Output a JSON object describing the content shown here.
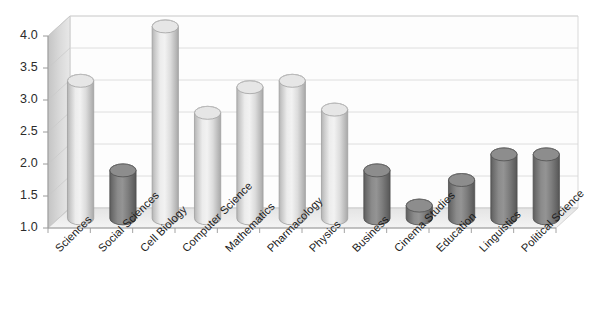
{
  "chart_data": {
    "type": "bar",
    "title": "",
    "subtitle": "",
    "xlabel": "",
    "ylabel": "",
    "ylim": [
      1.0,
      4.0
    ],
    "yticks": [
      "1.0",
      "1.5",
      "2.0",
      "2.5",
      "3.0",
      "3.5",
      "4.0"
    ],
    "ytick_values": [
      1.0,
      1.5,
      2.0,
      2.5,
      3.0,
      3.5,
      4.0
    ],
    "grid": true,
    "legend": "none",
    "style": "3d-cylinder",
    "categories": [
      "Sciences",
      "Social Sciences",
      "Cell Biology",
      "Computer Science",
      "Mathematics",
      "Pharmacology",
      "Physics",
      "Business",
      "Cinema Studies",
      "Education",
      "Linguistics",
      "Political Science"
    ],
    "values": [
      3.15,
      1.75,
      4.0,
      2.65,
      3.05,
      3.15,
      2.7,
      1.75,
      1.2,
      1.6,
      2.0,
      2.0
    ],
    "bar_colors": [
      "#d9d9d9",
      "#808080",
      "#d9d9d9",
      "#d9d9d9",
      "#d9d9d9",
      "#d9d9d9",
      "#d9d9d9",
      "#808080",
      "#808080",
      "#808080",
      "#808080",
      "#808080"
    ]
  },
  "colors": {
    "background": "#ffffff",
    "plot_back_wall": "#fdfdfd",
    "side_wall": "#d2d2d2",
    "floor": "#eaeaea",
    "gridline": "#d6d6d6",
    "axis_line": "#9a9a9a",
    "bar_light": "#d9d9d9",
    "bar_dark": "#808080",
    "text": "#222222"
  }
}
